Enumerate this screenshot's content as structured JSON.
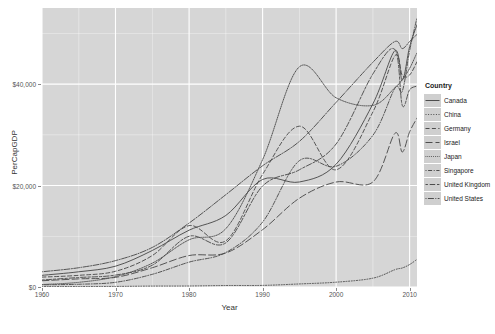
{
  "chart_data": {
    "type": "line",
    "title": "",
    "xlabel": "Year",
    "ylabel": "PerCapGDP",
    "xlim": [
      1960,
      2011
    ],
    "ylim": [
      0,
      55000
    ],
    "grid": true,
    "legend_position": "right",
    "legend_title": "Country",
    "x_ticks": [
      1960,
      1970,
      1980,
      1990,
      2000,
      2010
    ],
    "x_tick_labels": [
      "1960",
      "1970",
      "1980",
      "1990",
      "2000",
      "2010"
    ],
    "y_ticks": [
      0,
      20000,
      40000
    ],
    "y_tick_labels": [
      "$0",
      "$20,000",
      "$40,000"
    ],
    "x": [
      1960,
      1965,
      1970,
      1975,
      1980,
      1985,
      1990,
      1995,
      2000,
      2005,
      2008,
      2009,
      2010,
      2011
    ],
    "series": [
      {
        "name": "Canada",
        "dash": "solid",
        "values": [
          2300,
          3000,
          4100,
          7200,
          11200,
          14100,
          21200,
          20700,
          24200,
          36100,
          46600,
          40800,
          47400,
          51700
        ]
      },
      {
        "name": "China",
        "dash": "dotted",
        "values": [
          92,
          98,
          113,
          178,
          195,
          294,
          314,
          604,
          949,
          1740,
          3414,
          3749,
          4433,
          5447
        ]
      },
      {
        "name": "Germany",
        "dash": "dashed",
        "values": [
          1950,
          2300,
          3100,
          6200,
          12100,
          9100,
          22200,
          31700,
          23100,
          34500,
          45600,
          41700,
          41800,
          44400
        ]
      },
      {
        "name": "Israel",
        "dash": "longdash",
        "values": [
          1230,
          1600,
          1900,
          3800,
          6200,
          6700,
          11300,
          17500,
          20700,
          20700,
          30300,
          26600,
          30600,
          33300
        ]
      },
      {
        "name": "Japan",
        "dash": "dotdensesmall",
        "values": [
          479,
          920,
          2050,
          4700,
          9300,
          11500,
          25100,
          43400,
          37300,
          35800,
          39300,
          40900,
          43100,
          46200
        ]
      },
      {
        "name": "Singapore",
        "dash": "dotdash",
        "values": [
          428,
          540,
          925,
          2500,
          4900,
          6800,
          12800,
          24900,
          23800,
          29900,
          39200,
          38600,
          46600,
          53100
        ]
      },
      {
        "name": "United Kingdom",
        "dash": "twodash",
        "values": [
          1380,
          1870,
          2350,
          4300,
          10000,
          8700,
          19900,
          23100,
          28200,
          42000,
          46800,
          35800,
          38900,
          39600
        ]
      },
      {
        "name": "United States",
        "dash": "dotdashlong",
        "values": [
          3000,
          3800,
          5200,
          7800,
          12600,
          18200,
          23900,
          28700,
          36400,
          44300,
          48400,
          47000,
          48400,
          49800
        ]
      }
    ]
  },
  "legend": {
    "title": "Country",
    "items": [
      {
        "label": "Canada"
      },
      {
        "label": "China"
      },
      {
        "label": "Germany"
      },
      {
        "label": "Israel"
      },
      {
        "label": "Japan"
      },
      {
        "label": "Singapore"
      },
      {
        "label": "United Kingdom"
      },
      {
        "label": "United States"
      }
    ]
  },
  "colors": {
    "panel": "#d6d6d6",
    "grid": "#ffffff",
    "line": "#4d4d4d",
    "text": "#333333",
    "tick_text": "#555555",
    "legend_key": "#cfcfcf"
  }
}
